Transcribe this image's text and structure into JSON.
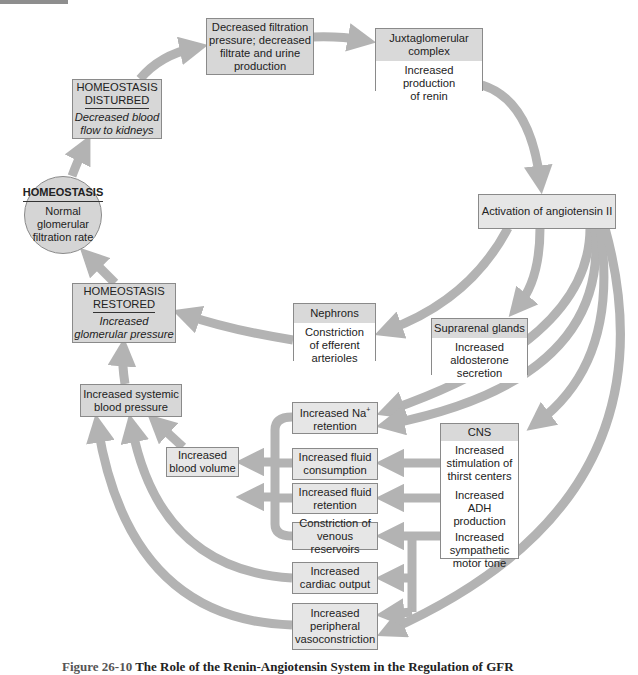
{
  "diagram": {
    "type": "flowchart",
    "colors": {
      "arrow": "#b3b3b3",
      "box_fill": "#d7d7d7",
      "box_light": "#e6e6e6",
      "header_fill": "#d9d9d9",
      "border": "#8a8a8a"
    },
    "homeostasis": {
      "title": "HOMEOSTASIS",
      "line1": "Normal",
      "line2": "glomerular",
      "line3": "filtration rate"
    },
    "disturbed": {
      "title1": "HOMEOSTASIS",
      "title2": "DISTURBED",
      "desc1": "Decreased blood",
      "desc2": "flow to kidneys"
    },
    "filtration": {
      "line1": "Decreased filtration",
      "line2": "pressure; decreased",
      "line3": "filtrate and urine",
      "line4": "production"
    },
    "juxtaglomerular": {
      "header1": "Juxtaglomerular",
      "header2": "complex",
      "body1": "Increased production",
      "body2": "of renin"
    },
    "angiotensin": {
      "label": "Activation of angiotensin II"
    },
    "nephrons": {
      "header": "Nephrons",
      "body1": "Constriction",
      "body2": "of efferent",
      "body3": "arterioles"
    },
    "suprarenal": {
      "header": "Suprarenal glands",
      "body1": "Increased",
      "body2": "aldosterone",
      "body3": "secretion"
    },
    "restored": {
      "title1": "HOMEOSTASIS",
      "title2": "RESTORED",
      "desc1": "Increased",
      "desc2": "glomerular pressure"
    },
    "systemic_bp": {
      "line1": "Increased systemic",
      "line2": "blood pressure"
    },
    "blood_volume": {
      "line1": "Increased",
      "line2": "blood volume"
    },
    "na_retention": {
      "line1": "Increased Na",
      "sup": "+",
      "line2": "retention"
    },
    "fluid_consumption": {
      "line1": "Increased fluid",
      "line2": "consumption"
    },
    "fluid_retention": {
      "line1": "Increased fluid",
      "line2": "retention"
    },
    "venous": {
      "line1": "Constriction of",
      "line2": "venous reservoirs"
    },
    "cardiac": {
      "line1": "Increased",
      "line2": "cardiac output"
    },
    "peripheral": {
      "line1": "Increased",
      "line2": "peripheral",
      "line3": "vasoconstriction"
    },
    "cns": {
      "header": "CNS",
      "item1_l1": "Increased",
      "item1_l2": "stimulation of",
      "item1_l3": "thirst centers",
      "item2_l1": "Increased ADH",
      "item2_l2": "production",
      "item3_l1": "Increased",
      "item3_l2": "sympathetic",
      "item3_l3": "motor tone"
    }
  },
  "caption": {
    "figure": "Figure 26-10",
    "text": "The Role of the Renin-Angiotensin System in the Regulation of GFR"
  }
}
